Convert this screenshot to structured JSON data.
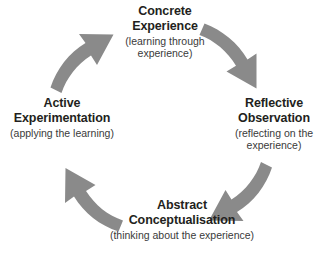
{
  "diagram": {
    "name": "Kolb's Experiential Learning Cycle",
    "direction": "clockwise",
    "arrow_color": "#8a8a8a",
    "background_color": "#ffffff",
    "text_color": "#231f20",
    "nodes": [
      {
        "id": "concrete-experience",
        "position": "top",
        "title": "Concrete\nExperience",
        "subtitle": "(learning through\nexperience)"
      },
      {
        "id": "reflective-observation",
        "position": "right",
        "title": "Reflective\nObservation",
        "subtitle": "(reflecting on the\nexperience)"
      },
      {
        "id": "abstract-conceptualisation",
        "position": "bottom",
        "title": "Abstract\nConceptualisation",
        "subtitle": "(thinking about the experience)"
      },
      {
        "id": "active-experimentation",
        "position": "left",
        "title": "Active\nExperimentation",
        "subtitle": "(applying the learning)"
      }
    ],
    "arrows": [
      {
        "id": "arrow-concrete-to-reflective",
        "from": "concrete-experience",
        "to": "reflective-observation",
        "quadrant": "top-right"
      },
      {
        "id": "arrow-reflective-to-abstract",
        "from": "reflective-observation",
        "to": "abstract-conceptualisation",
        "quadrant": "bottom-right"
      },
      {
        "id": "arrow-abstract-to-active",
        "from": "abstract-conceptualisation",
        "to": "active-experimentation",
        "quadrant": "bottom-left"
      },
      {
        "id": "arrow-active-to-concrete",
        "from": "active-experimentation",
        "to": "concrete-experience",
        "quadrant": "top-left"
      }
    ]
  }
}
